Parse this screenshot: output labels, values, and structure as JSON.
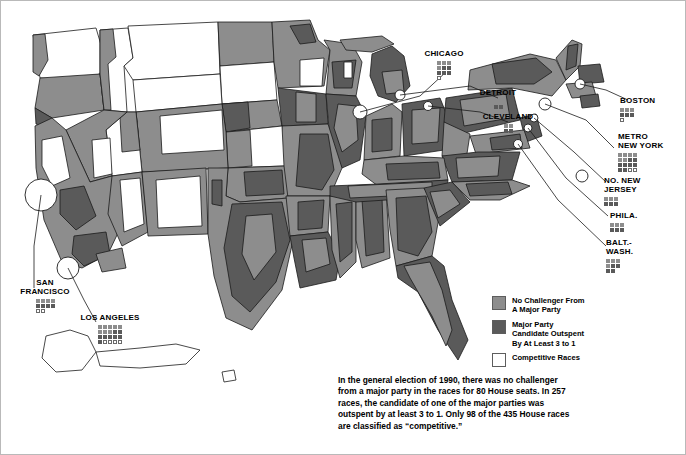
{
  "map": {
    "title": "1990 U.S. House Races Competitiveness Map",
    "colors": {
      "no_challenger": "#8d8d8d",
      "outspent": "#5a5a5a",
      "competitive": "#ffffff",
      "outline": "#1a1a1a",
      "background": "#ffffff",
      "frame": "#b9b9b9"
    },
    "city_callouts": [
      {
        "name": "chicago",
        "label": "CHICAGO",
        "x": 442,
        "y": 49,
        "dots_no_challenger": 4,
        "dots_outspent": 5,
        "dots_competitive": 1,
        "grid_cols": 3
      },
      {
        "name": "detroit",
        "label": "DETROIT",
        "x": 494,
        "y": 88,
        "dots_no_challenger": 2,
        "dots_outspent": 2,
        "dots_competitive": 0,
        "grid_cols": 2
      },
      {
        "name": "cleveland",
        "label": "CLEVELAND",
        "x": 504,
        "y": 112,
        "dots_no_challenger": 2,
        "dots_outspent": 2,
        "dots_competitive": 0,
        "grid_cols": 2
      },
      {
        "name": "boston",
        "label": "BOSTON",
        "x": 630,
        "y": 96,
        "dots_no_challenger": 3,
        "dots_outspent": 3,
        "dots_competitive": 1,
        "grid_cols": 3
      },
      {
        "name": "metro-new-york",
        "label": "METRO\nNEW YORK",
        "x": 626,
        "y": 135,
        "dots_no_challenger": 6,
        "dots_outspent": 8,
        "dots_competitive": 2,
        "grid_cols": 4
      },
      {
        "name": "northern-new-jersey",
        "label": "NO. NEW\nJERSEY",
        "x": 612,
        "y": 176,
        "dots_no_challenger": 3,
        "dots_outspent": 3,
        "dots_competitive": 0,
        "grid_cols": 3
      },
      {
        "name": "philadelphia",
        "label": "PHILA.",
        "x": 620,
        "y": 211,
        "dots_no_challenger": 3,
        "dots_outspent": 3,
        "dots_competitive": 0,
        "grid_cols": 3
      },
      {
        "name": "baltimore-washington",
        "label": "BALT.-\nWASH.",
        "x": 614,
        "y": 238,
        "dots_no_challenger": 4,
        "dots_outspent": 4,
        "dots_competitive": 0,
        "grid_cols": 3
      },
      {
        "name": "san-francisco",
        "label": "SAN\nFRANCISCO",
        "x": 20,
        "y": 278,
        "dots_no_challenger": 4,
        "dots_outspent": 4,
        "dots_competitive": 2,
        "grid_cols": 4
      },
      {
        "name": "los-angeles",
        "label": "LOS ANGELES",
        "x": 82,
        "y": 313,
        "dots_no_challenger": 8,
        "dots_outspent": 8,
        "dots_competitive": 4,
        "grid_cols": 5
      }
    ]
  },
  "legend": {
    "title": "",
    "items": [
      {
        "name": "no-challenger",
        "label": "No Challenger From\nA Major Party",
        "color": "#8d8d8d"
      },
      {
        "name": "outspent",
        "label": "Major Party\nCandidate Outspent\nBy At Least 3 to 1",
        "color": "#5a5a5a"
      },
      {
        "name": "competitive",
        "label": "Competitive Races",
        "color": "#ffffff"
      }
    ]
  },
  "caption": {
    "text": "In the general election of 1990, there was no challenger from a major party in the races for 80 House seats. In 257 races, the candidate of one of the major parties was outspent by at least 3 to 1. Only 98 of the 435 House races are classified as “competitive.”",
    "stats": {
      "no_challenger_seats": 80,
      "outspent_races": 257,
      "competitive_races": 98,
      "total_races": 435,
      "election_year": 1990
    }
  }
}
